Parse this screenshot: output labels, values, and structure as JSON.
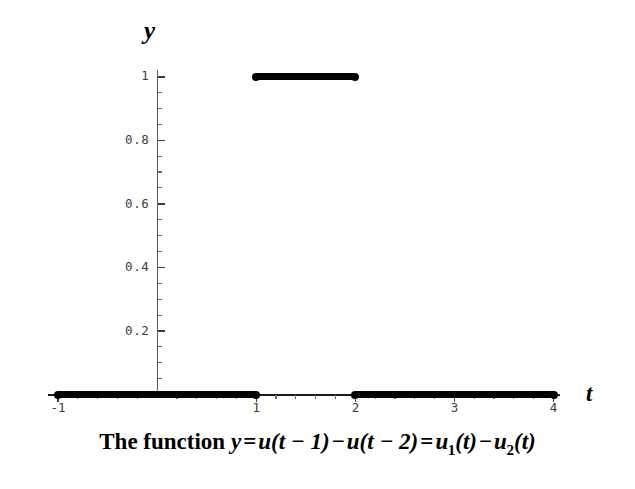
{
  "chart_data": {
    "type": "line",
    "title": "",
    "caption": "The function y = u(t − 1) − u(t − 2) = u₁(t) − u₂(t)",
    "xlabel": "t",
    "ylabel": "y",
    "xlim": [
      -1,
      4
    ],
    "ylim": [
      0,
      1
    ],
    "grid": false,
    "legend": null,
    "x_major_ticks": [
      -1,
      1,
      2,
      3,
      4
    ],
    "x_major_tick_labels": [
      "-1",
      "1",
      "2",
      "3",
      "4"
    ],
    "x_minor_tick_step": 0.2,
    "y_major_ticks": [
      0.2,
      0.4,
      0.6,
      0.8,
      1
    ],
    "y_major_tick_labels": [
      "0.2",
      "0.4",
      "0.6",
      "0.8",
      "1"
    ],
    "y_minor_tick_step": 0.05,
    "series": [
      {
        "name": "y = u(t-1) - u(t-2)",
        "color": "#000000",
        "style": "thick-step",
        "segments": [
          {
            "x_start": -1,
            "x_end": 1,
            "y": 0
          },
          {
            "x_start": 1,
            "x_end": 2,
            "y": 1
          },
          {
            "x_start": 2,
            "x_end": 4,
            "y": 0
          }
        ],
        "endpoints": [
          {
            "x": -1,
            "y": 0
          },
          {
            "x": 1,
            "y": 0
          },
          {
            "x": 1,
            "y": 1
          },
          {
            "x": 2,
            "y": 1
          },
          {
            "x": 2,
            "y": 0
          },
          {
            "x": 4,
            "y": 0
          }
        ]
      }
    ]
  },
  "axes": {
    "y_label": "y",
    "t_label": "t",
    "y_tick_labels": [
      "1",
      "0.8",
      "0.6",
      "0.4",
      "0.2"
    ],
    "t_tick_labels": [
      "-1",
      "1",
      "2",
      "3",
      "4"
    ]
  },
  "caption": {
    "prefix": "The function ",
    "y": "y",
    "eq1": "=",
    "u1": "u",
    "term1": "(t − 1)",
    "minus1": "−",
    "u2": "u",
    "term2": "(t − 2)",
    "eq2": "=",
    "u3": "u",
    "sub1": "1",
    "arg1": "(t)",
    "minus2": "−",
    "u4": "u",
    "sub2": "2",
    "arg2": "(t)",
    "full_text": "The function y = u(t − 1) − u(t − 2) = u₁(t) − u₂(t)"
  },
  "colors": {
    "curve": "#000000",
    "axis": "#3d3d3d",
    "background": "#ffffff"
  }
}
